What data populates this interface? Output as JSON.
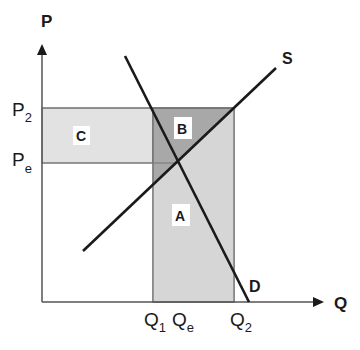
{
  "diagram": {
    "title": "",
    "axes": {
      "y_label": "P",
      "x_label": "Q"
    },
    "price_ticks": [
      {
        "main": "P",
        "sub": "2"
      },
      {
        "main": "P",
        "sub": "e"
      }
    ],
    "quantity_ticks": [
      {
        "main": "Q",
        "sub": "1"
      },
      {
        "main": "Q",
        "sub": "e"
      },
      {
        "main": "Q",
        "sub": "2"
      }
    ],
    "curves": {
      "supply": "S",
      "demand": "D"
    },
    "regions": {
      "a": "A",
      "b": "B",
      "c": "C"
    },
    "colors": {
      "line": "#1a1a1a",
      "axis": "#555555",
      "region_a": "#d8d8d8",
      "region_b": "#a9a9a9",
      "region_c": "#e0e0e0",
      "label_bg": "#ffffff"
    }
  }
}
